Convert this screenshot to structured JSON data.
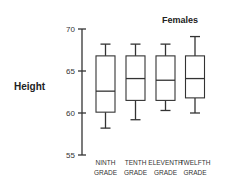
{
  "chart_data": {
    "type": "boxplot",
    "title": "Females",
    "xlabel": "",
    "ylabel": "Height",
    "ylim": [
      55,
      70
    ],
    "yticks": [
      55,
      60,
      65,
      70
    ],
    "grid": false,
    "categories": [
      {
        "line1": "NINTH",
        "line2": "GRADE"
      },
      {
        "line1": "TENTH",
        "line2": "GRADE"
      },
      {
        "line1": "ELEVENTH",
        "line2": "GRADE"
      },
      {
        "line1": "TWELFTH",
        "line2": "GRADE"
      }
    ],
    "series": [
      {
        "name": "Ninth Grade",
        "min": 58.2,
        "q1": 60.1,
        "median": 62.6,
        "q3": 66.8,
        "max": 68.2
      },
      {
        "name": "Tenth Grade",
        "min": 59.2,
        "q1": 61.5,
        "median": 64.1,
        "q3": 66.8,
        "max": 68.2
      },
      {
        "name": "Eleventh Grade",
        "min": 60.3,
        "q1": 61.5,
        "median": 63.9,
        "q3": 66.8,
        "max": 68.2
      },
      {
        "name": "Twelfth Grade",
        "min": 60.0,
        "q1": 61.8,
        "median": 64.1,
        "q3": 66.8,
        "max": 69.1
      }
    ]
  }
}
